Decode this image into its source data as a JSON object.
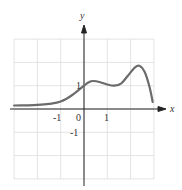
{
  "chart_data": {
    "type": "line",
    "title": "",
    "xlabel": "x",
    "ylabel": "y",
    "xlim": [
      -3,
      3
    ],
    "ylim": [
      -3,
      3
    ],
    "grid": true,
    "x_tick_labels": [
      "-1",
      "1"
    ],
    "y_tick_labels": [
      "1",
      "-1"
    ],
    "origin_label": "0",
    "series": [
      {
        "name": "f(x)",
        "x": [
          -3,
          -2.5,
          -2,
          -1.5,
          -1,
          -0.5,
          0,
          0.2,
          0.4,
          0.7,
          1.0,
          1.3,
          1.6,
          1.9,
          2.2,
          2.4,
          2.6,
          2.8,
          2.95
        ],
        "y": [
          0.15,
          0.16,
          0.18,
          0.22,
          0.32,
          0.6,
          1.0,
          1.15,
          1.2,
          1.15,
          1.05,
          1.0,
          1.1,
          1.45,
          1.8,
          1.85,
          1.6,
          1.0,
          0.3
        ]
      }
    ],
    "colors": {
      "curve": "#6b6b6b",
      "axis": "#222222",
      "grid": "#d9d9d9"
    }
  },
  "labels": {
    "x_axis": "x",
    "y_axis": "y",
    "origin": "0",
    "x_neg1": "-1",
    "x_pos1": "1",
    "y_pos1": "1",
    "y_neg1": "-1"
  }
}
